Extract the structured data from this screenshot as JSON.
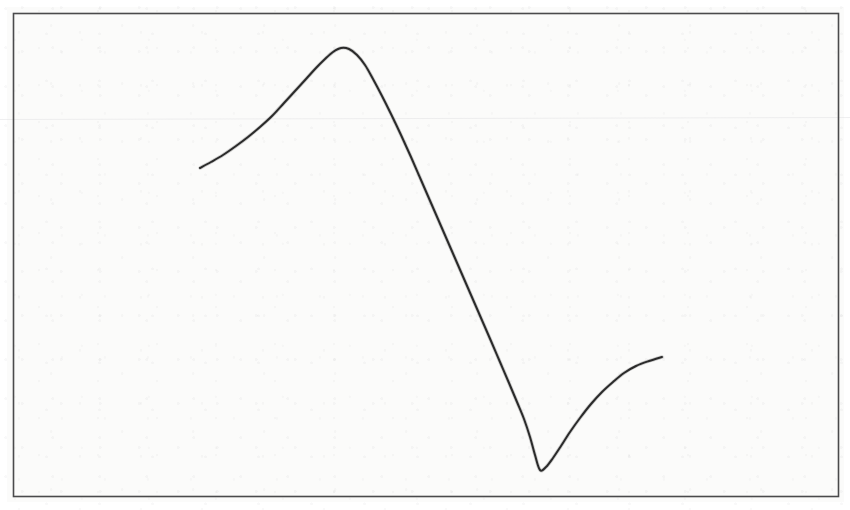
{
  "figure": {
    "media": "scanned-document-figure",
    "background_color": "#fbfbfa",
    "page_color": "#ffffff",
    "frame": {
      "present": true,
      "color": "#4a4a4c",
      "line_width_px": 1.6,
      "x": 13,
      "y": 13,
      "width": 825,
      "height": 483
    },
    "artifacts": {
      "scan_line": {
        "present": true,
        "orientation": "horizontal",
        "y": 119,
        "color": "#e2e2e4",
        "opacity": 0.55
      },
      "speckle": "faint-gray-paper-grain"
    }
  },
  "chart_data": {
    "type": "line",
    "title": "",
    "subtitle": "",
    "xlabel": "",
    "ylabel": "",
    "grid": false,
    "legend": null,
    "axis_ticks": false,
    "tick_labels": [],
    "annotations": [],
    "axis_ranges": {
      "x_pixels": [
        13,
        838
      ],
      "y_pixels": [
        13,
        496
      ]
    },
    "series": [
      {
        "name": "curve",
        "color": "#2a2a2a",
        "line_width_px": 2.0,
        "shape_description": "dispersion-like curve: rises to a sharp maximum, falls steeply through an inflection to a sharp minimum, then rises again",
        "features": {
          "start_point": [
            200,
            168
          ],
          "maximum": [
            341,
            48
          ],
          "inflection": [
            450,
            262
          ],
          "minimum": [
            540,
            470
          ],
          "end_point": [
            662,
            357
          ]
        },
        "points": [
          [
            200,
            168
          ],
          [
            211,
            162
          ],
          [
            223,
            155
          ],
          [
            236,
            146
          ],
          [
            248,
            137
          ],
          [
            260,
            127
          ],
          [
            272,
            116
          ],
          [
            284,
            103
          ],
          [
            295,
            91
          ],
          [
            306,
            79
          ],
          [
            316,
            68
          ],
          [
            325,
            59
          ],
          [
            333,
            52
          ],
          [
            341,
            48
          ],
          [
            349,
            49
          ],
          [
            357,
            55
          ],
          [
            365,
            65
          ],
          [
            373,
            79
          ],
          [
            382,
            96
          ],
          [
            391,
            114
          ],
          [
            401,
            135
          ],
          [
            411,
            157
          ],
          [
            421,
            180
          ],
          [
            431,
            203
          ],
          [
            441,
            226
          ],
          [
            451,
            249
          ],
          [
            461,
            272
          ],
          [
            471,
            295
          ],
          [
            481,
            318
          ],
          [
            491,
            341
          ],
          [
            500,
            362
          ],
          [
            509,
            383
          ],
          [
            517,
            402
          ],
          [
            524,
            419
          ],
          [
            530,
            437
          ],
          [
            535,
            455
          ],
          [
            540,
            470
          ],
          [
            546,
            467
          ],
          [
            553,
            458
          ],
          [
            561,
            446
          ],
          [
            570,
            432
          ],
          [
            580,
            418
          ],
          [
            591,
            404
          ],
          [
            602,
            392
          ],
          [
            613,
            382
          ],
          [
            624,
            373
          ],
          [
            636,
            366
          ],
          [
            649,
            361
          ],
          [
            662,
            357
          ]
        ]
      }
    ]
  }
}
